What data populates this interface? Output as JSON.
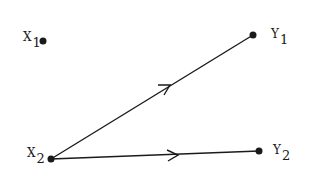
{
  "diagram": {
    "type": "path-diagram",
    "nodes": [
      {
        "id": "X1",
        "letter": "X",
        "subscript": "1",
        "x": 43,
        "y": 41
      },
      {
        "id": "Y1",
        "letter": "Y",
        "subscript": "1",
        "x": 253,
        "y": 35
      },
      {
        "id": "X2",
        "letter": "X",
        "subscript": "2",
        "x": 51,
        "y": 159
      },
      {
        "id": "Y2",
        "letter": "Y",
        "subscript": "2",
        "x": 259,
        "y": 151
      }
    ],
    "edges": [
      {
        "from": "X2",
        "to": "Y1",
        "directed": true
      },
      {
        "from": "X2",
        "to": "Y2",
        "directed": true
      }
    ],
    "colors": {
      "line": "#1a1a1a",
      "background": "#ffffff"
    }
  }
}
